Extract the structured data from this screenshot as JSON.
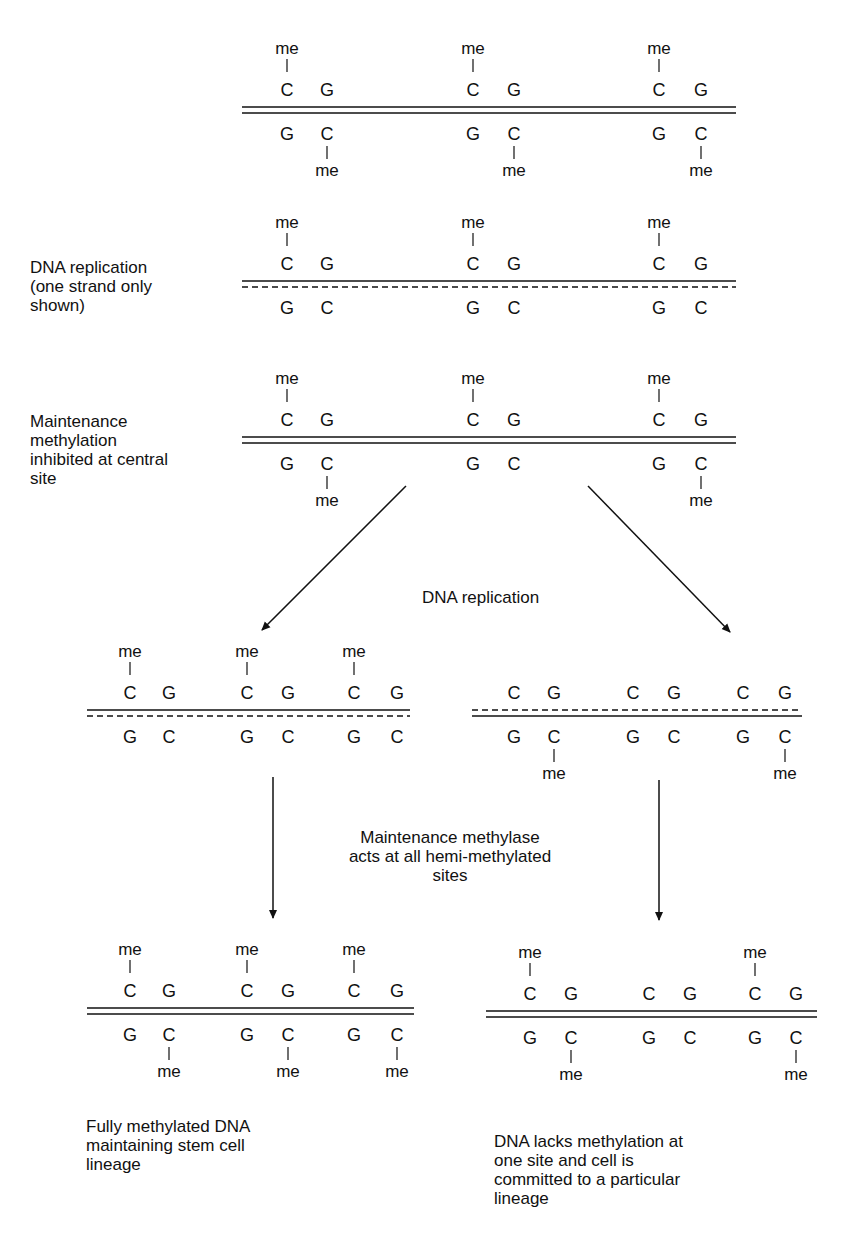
{
  "diagram": {
    "colors": {
      "ink": "#111111",
      "background": "#ffffff"
    },
    "symbols": {
      "methyl": "me",
      "cytosine": "C",
      "guanine": "G"
    },
    "labels": {
      "step2": "DNA replication\n(one strand only\nshown)",
      "step3": "Maintenance\nmethylation\ninhibited at central\nsite",
      "branch_replication": "DNA replication",
      "methylase_note": "Maintenance methylase\nacts at all hemi-methylated\nsites",
      "outcome_left": "Fully methylated DNA\nmaintaining stem cell\nlineage",
      "outcome_right": "DNA lacks methylation at\none site and cell is\ncommitted to a particular\nlineage"
    },
    "duplexes": [
      {
        "id": "parent-fully-methylated",
        "x1": 242,
        "x2": 736,
        "lineY": 110,
        "top_strand": "solid",
        "bottom_strand": "solid",
        "sites": [
          {
            "cx": 287,
            "gx": 327,
            "top_me": true,
            "bottom_me": true
          },
          {
            "cx": 473,
            "gx": 514,
            "top_me": true,
            "bottom_me": true
          },
          {
            "cx": 659,
            "gx": 701,
            "top_me": true,
            "bottom_me": true
          }
        ]
      },
      {
        "id": "hemimethylated-after-replication",
        "x1": 242,
        "x2": 736,
        "lineY": 284,
        "top_strand": "solid",
        "bottom_strand": "dashed",
        "sites": [
          {
            "cx": 287,
            "gx": 327,
            "top_me": true,
            "bottom_me": false
          },
          {
            "cx": 473,
            "gx": 514,
            "top_me": true,
            "bottom_me": false
          },
          {
            "cx": 659,
            "gx": 701,
            "top_me": true,
            "bottom_me": false
          }
        ]
      },
      {
        "id": "central-site-inhibited",
        "x1": 242,
        "x2": 736,
        "lineY": 440,
        "top_strand": "solid",
        "bottom_strand": "solid",
        "sites": [
          {
            "cx": 287,
            "gx": 327,
            "top_me": true,
            "bottom_me": true
          },
          {
            "cx": 473,
            "gx": 514,
            "top_me": true,
            "bottom_me": false
          },
          {
            "cx": 659,
            "gx": 701,
            "top_me": true,
            "bottom_me": true
          }
        ]
      },
      {
        "id": "left-daughter-hemimethylated",
        "x1": 87,
        "x2": 410,
        "lineY": 713,
        "top_strand": "solid",
        "bottom_strand": "dashed",
        "sites": [
          {
            "cx": 130,
            "gx": 169,
            "top_me": true,
            "bottom_me": false
          },
          {
            "cx": 247,
            "gx": 288,
            "top_me": true,
            "bottom_me": false
          },
          {
            "cx": 354,
            "gx": 397,
            "top_me": true,
            "bottom_me": false
          }
        ]
      },
      {
        "id": "right-daughter-hemimethylated",
        "x1": 472,
        "x2": 802,
        "lineY": 713,
        "top_strand": "dashed",
        "bottom_strand": "solid",
        "sites": [
          {
            "cx": 514,
            "gx": 554,
            "top_me": false,
            "bottom_me": true
          },
          {
            "cx": 633,
            "gx": 674,
            "top_me": false,
            "bottom_me": false
          },
          {
            "cx": 743,
            "gx": 785,
            "top_me": false,
            "bottom_me": true
          }
        ]
      },
      {
        "id": "left-fully-methylated",
        "x1": 87,
        "x2": 414,
        "lineY": 1011,
        "top_strand": "solid",
        "bottom_strand": "solid",
        "sites": [
          {
            "cx": 130,
            "gx": 169,
            "top_me": true,
            "bottom_me": true
          },
          {
            "cx": 247,
            "gx": 288,
            "top_me": true,
            "bottom_me": true
          },
          {
            "cx": 354,
            "gx": 397,
            "top_me": true,
            "bottom_me": true
          }
        ]
      },
      {
        "id": "right-committed-lineage",
        "x1": 486,
        "x2": 817,
        "lineY": 1014,
        "top_strand": "solid",
        "bottom_strand": "solid",
        "sites": [
          {
            "cx": 530,
            "gx": 571,
            "top_me": true,
            "bottom_me": true
          },
          {
            "cx": 649,
            "gx": 690,
            "top_me": false,
            "bottom_me": false
          },
          {
            "cx": 755,
            "gx": 796,
            "top_me": true,
            "bottom_me": true
          }
        ]
      }
    ],
    "arrows": [
      {
        "id": "arrow-to-left-daughter",
        "x1": 406,
        "y1": 486,
        "x2": 262,
        "y2": 630
      },
      {
        "id": "arrow-to-right-daughter",
        "x1": 588,
        "y1": 486,
        "x2": 730,
        "y2": 632
      },
      {
        "id": "arrow-left-down",
        "x1": 273,
        "y1": 777,
        "x2": 273,
        "y2": 918
      },
      {
        "id": "arrow-right-down",
        "x1": 659,
        "y1": 780,
        "x2": 659,
        "y2": 920
      }
    ]
  }
}
